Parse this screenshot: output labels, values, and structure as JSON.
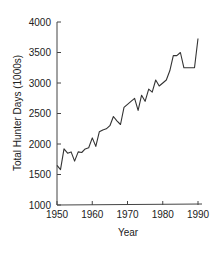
{
  "chart_data": {
    "type": "line",
    "title": "",
    "xlabel": "Year",
    "ylabel": "Total Hunter Days (1000s)",
    "xlim": [
      1950,
      1990
    ],
    "ylim": [
      1000,
      4000
    ],
    "x_ticks": [
      "1950",
      "1960",
      "1970",
      "1980",
      "1990"
    ],
    "y_ticks": [
      "1000",
      "1500",
      "2000",
      "2500",
      "3000",
      "3500",
      "4000"
    ],
    "grid": false,
    "legend": null,
    "series": [
      {
        "name": "Total Hunter Days",
        "color": "#333333",
        "x": [
          1950,
          1951,
          1952,
          1953,
          1954,
          1955,
          1956,
          1957,
          1958,
          1959,
          1960,
          1961,
          1962,
          1963,
          1964,
          1965,
          1966,
          1967,
          1968,
          1969,
          1970,
          1971,
          1972,
          1973,
          1974,
          1975,
          1976,
          1977,
          1978,
          1979,
          1980,
          1981,
          1982,
          1983,
          1984,
          1985,
          1986,
          1987,
          1988,
          1989,
          1990
        ],
        "values": [
          1650,
          1580,
          1920,
          1850,
          1870,
          1720,
          1870,
          1860,
          1920,
          1940,
          2100,
          1960,
          2200,
          2230,
          2250,
          2300,
          2450,
          2380,
          2320,
          2600,
          2650,
          2700,
          2750,
          2550,
          2800,
          2700,
          2900,
          2850,
          3050,
          2950,
          3000,
          3050,
          3200,
          3450,
          3450,
          3500,
          3250,
          3250,
          3250,
          3250,
          3730
        ]
      }
    ]
  }
}
